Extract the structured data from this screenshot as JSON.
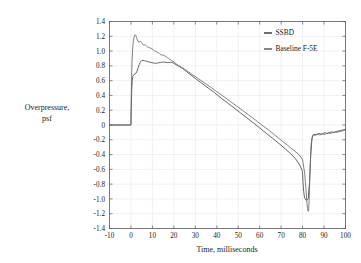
{
  "chart_data": {
    "type": "line",
    "title": "",
    "xlabel": "Time, milliseconds",
    "ylabel": "Overpressure,\npsf",
    "ylabel_line1": "Overpressure,",
    "ylabel_line2": "psf",
    "xlim": [
      -10,
      100
    ],
    "ylim": [
      -1.4,
      1.4
    ],
    "xticks": [
      -10,
      0,
      10,
      20,
      30,
      40,
      50,
      60,
      70,
      80,
      90,
      100
    ],
    "xticklabels": [
      "-10",
      "0",
      "10",
      "20",
      "30",
      "40",
      "50",
      "60",
      "70",
      "80",
      "90",
      "100"
    ],
    "yticks": [
      -1.4,
      -1.2,
      -1.0,
      -0.8,
      -0.6,
      -0.4,
      -0.2,
      0,
      0.2,
      0.4,
      0.6,
      0.8,
      1.0,
      1.2,
      1.4
    ],
    "yticklabels": [
      "-1.4",
      "-1.2",
      "-1.0",
      "-0.8",
      "-0.6",
      "-0.4",
      "-0.2",
      "0",
      "0.2",
      "0.4",
      "0.6",
      "0.8",
      "1.0",
      "1.2",
      "1.4"
    ],
    "grid": true,
    "legend_position": "upper right",
    "legend": [
      "SSBD",
      "Baseline F-5E"
    ],
    "series": [
      {
        "name": "SSBD",
        "color": "#4a4a4a",
        "x": [
          -10.0,
          -4.0,
          -1.2,
          -0.45,
          -0.3,
          -0.12,
          0.0,
          0.15,
          0.35,
          0.6,
          0.9,
          1.3,
          1.8,
          2.3,
          2.9,
          3.4,
          3.9,
          4.4,
          5.0,
          5.6,
          6.2,
          6.8,
          7.4,
          8.0,
          8.7,
          9.4,
          10.1,
          10.8,
          11.5,
          12.2,
          12.9,
          13.6,
          14.3,
          15.0,
          15.7,
          16.4,
          17.1,
          17.8,
          18.5,
          19.3,
          20.2,
          21.4,
          22.6,
          24.0,
          26.0,
          28.0,
          30.0,
          33.0,
          36.0,
          39.0,
          42.0,
          45.0,
          48.0,
          51.0,
          54.0,
          57.0,
          60.0,
          63.0,
          66.0,
          69.0,
          72.0,
          74.5,
          76.5,
          78.0,
          79.0,
          79.6,
          79.9,
          80.05,
          80.2,
          80.5,
          80.9,
          81.4,
          82.0,
          82.6,
          83.2,
          83.8,
          84.4,
          85.0,
          85.7,
          86.4,
          87.1,
          87.8,
          88.5,
          89.2,
          89.9,
          90.6,
          91.3,
          92.0,
          92.8,
          93.6,
          94.4,
          95.2,
          96.0,
          96.8,
          97.6,
          98.4,
          99.2,
          100.0
        ],
        "y": [
          0.0,
          0.0,
          0.0,
          0.0,
          0.0,
          0.0,
          0.0,
          0.22,
          0.46,
          0.6,
          0.66,
          0.68,
          0.69,
          0.7,
          0.73,
          0.78,
          0.82,
          0.85,
          0.87,
          0.875,
          0.87,
          0.865,
          0.862,
          0.858,
          0.85,
          0.845,
          0.84,
          0.838,
          0.835,
          0.838,
          0.842,
          0.845,
          0.848,
          0.852,
          0.85,
          0.846,
          0.843,
          0.846,
          0.85,
          0.845,
          0.83,
          0.81,
          0.79,
          0.765,
          0.72,
          0.675,
          0.63,
          0.565,
          0.5,
          0.435,
          0.365,
          0.3,
          0.232,
          0.165,
          0.098,
          0.03,
          -0.04,
          -0.11,
          -0.18,
          -0.25,
          -0.325,
          -0.39,
          -0.45,
          -0.51,
          -0.56,
          -0.6,
          -0.63,
          -0.68,
          -0.78,
          -0.9,
          -0.98,
          -1.01,
          -1.02,
          -1.0,
          -0.78,
          -0.4,
          -0.18,
          -0.13,
          -0.125,
          -0.13,
          -0.12,
          -0.115,
          -0.125,
          -0.12,
          -0.11,
          -0.105,
          -0.115,
          -0.11,
          -0.1,
          -0.095,
          -0.1,
          -0.095,
          -0.085,
          -0.08,
          -0.075,
          -0.07,
          -0.065,
          -0.06
        ]
      },
      {
        "name": "Baseline F-5E",
        "color": "#6a6a6a",
        "x": [
          -10.0,
          -4.0,
          -1.2,
          -0.45,
          -0.3,
          -0.12,
          0.0,
          0.12,
          0.3,
          0.55,
          0.85,
          1.15,
          1.45,
          1.75,
          2.05,
          2.3,
          2.6,
          3.0,
          3.5,
          4.0,
          4.5,
          5.0,
          5.5,
          6.0,
          6.5,
          7.0,
          7.5,
          8.0,
          8.6,
          9.2,
          9.8,
          10.4,
          11.0,
          11.6,
          12.2,
          12.8,
          13.4,
          14.0,
          14.6,
          15.2,
          15.8,
          16.4,
          17.0,
          17.6,
          18.2,
          18.8,
          19.5,
          20.3,
          21.2,
          22.2,
          23.4,
          25.0,
          27.0,
          29.0,
          31.0,
          34.0,
          37.0,
          40.0,
          43.0,
          46.0,
          49.0,
          52.0,
          55.0,
          58.0,
          61.0,
          64.0,
          67.0,
          70.0,
          73.0,
          76.0,
          78.5,
          80.0,
          81.0,
          81.6,
          82.0,
          82.3,
          82.5,
          82.65,
          82.8,
          83.1,
          83.5,
          84.0,
          84.6,
          85.2,
          85.9,
          86.6,
          87.3,
          88.0,
          88.7,
          89.4,
          90.1,
          90.8,
          91.5,
          92.2,
          93.0,
          93.8,
          94.6,
          95.4,
          96.2,
          97.0,
          97.8,
          98.6,
          99.3,
          100.0
        ],
        "y": [
          0.0,
          0.0,
          0.0,
          0.0,
          0.0,
          0.0,
          0.0,
          0.32,
          0.66,
          0.9,
          1.05,
          1.14,
          1.19,
          1.215,
          1.22,
          1.21,
          1.185,
          1.15,
          1.12,
          1.125,
          1.13,
          1.115,
          1.09,
          1.08,
          1.085,
          1.075,
          1.06,
          1.05,
          1.045,
          1.04,
          1.03,
          1.02,
          1.0,
          0.995,
          0.985,
          0.975,
          0.965,
          0.95,
          0.945,
          0.945,
          0.935,
          0.925,
          0.91,
          0.9,
          0.885,
          0.875,
          0.862,
          0.845,
          0.825,
          0.805,
          0.785,
          0.755,
          0.715,
          0.675,
          0.635,
          0.575,
          0.515,
          0.45,
          0.39,
          0.325,
          0.262,
          0.198,
          0.132,
          0.068,
          0.0,
          -0.065,
          -0.135,
          -0.205,
          -0.275,
          -0.345,
          -0.405,
          -0.47,
          -0.66,
          -0.88,
          -1.05,
          -1.13,
          -1.16,
          -1.17,
          -1.16,
          -0.98,
          -0.6,
          -0.25,
          -0.145,
          -0.135,
          -0.14,
          -0.13,
          -0.128,
          -0.135,
          -0.125,
          -0.12,
          -0.13,
          -0.12,
          -0.11,
          -0.105,
          -0.115,
          -0.105,
          -0.1,
          -0.095,
          -0.1,
          -0.09,
          -0.085,
          -0.08,
          -0.07,
          -0.065
        ]
      }
    ]
  },
  "colors": {
    "ssbd": "#4a4a4a",
    "baseline": "#6a6a6a",
    "axis": "#5a5a5a",
    "grid": "#e8e8e8",
    "background": "#ffffff"
  }
}
